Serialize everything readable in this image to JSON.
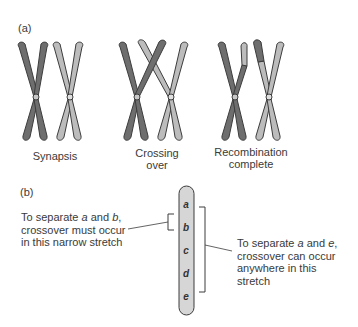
{
  "panel_a": {
    "label": "(a)",
    "stages": [
      {
        "label_line1": "Synapsis",
        "label_line2": ""
      },
      {
        "label_line1": "Crossing",
        "label_line2": "over"
      },
      {
        "label_line1": "Recombination",
        "label_line2": "complete"
      }
    ]
  },
  "panel_b": {
    "label": "(b)",
    "genes": [
      "a",
      "b",
      "c",
      "d",
      "e"
    ],
    "left_note": {
      "line1_prefix": "To separate ",
      "line1_g1": "a",
      "line1_mid": " and ",
      "line1_g2": "b",
      "line1_suffix": ",",
      "line2": "crossover must occur",
      "line3": "in this narrow stretch"
    },
    "right_note": {
      "line1_prefix": "To separate ",
      "line1_g1": "a",
      "line1_mid": " and ",
      "line1_g2": "e",
      "line1_suffix": ",",
      "line2": "crossover can occur",
      "line3": "anywhere in this",
      "line4": "stretch"
    }
  },
  "colors": {
    "dark_chromosome": "#6b6b6b",
    "light_chromosome": "#b8b8b8",
    "outline": "#3c3c3c",
    "bar_fill": "#d6d6d6"
  }
}
